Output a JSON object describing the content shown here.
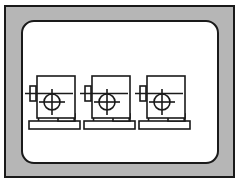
{
  "figure": {
    "kind": "technical-line-drawing",
    "background_color": "#ffffff",
    "frame": {
      "outer_stroke_color": "#1a1a1a",
      "band_fill_color": "#b6b6b6",
      "inner_panel_fill_color": "#ffffff",
      "inner_panel_stroke_color": "#1a1a1a",
      "inner_panel_corner_radius": 13
    },
    "line_color": "#1a1a1a",
    "fill_color": "#ffffff",
    "machine_count": 3,
    "machines": [
      {
        "label": "machine-1",
        "origin_x": 8,
        "origin_y": 0
      },
      {
        "label": "machine-2",
        "origin_x": 63,
        "origin_y": 0
      },
      {
        "label": "machine-3",
        "origin_x": 118,
        "origin_y": 0
      }
    ],
    "machine_parts": [
      "column-body",
      "spindle-bracket",
      "horizontal-axis-line",
      "crosshair-circle",
      "table-riser-block",
      "base-plate",
      "left-leg",
      "right-leg"
    ],
    "geometry": {
      "body_x": 8,
      "body_y": 56,
      "body_width": 38,
      "body_height": 42,
      "bracket_x": 0,
      "bracket_y": 66,
      "bracket_width": 6,
      "bracket_height": 15,
      "axis_line_y": 73,
      "axis_line_x1": -4,
      "axis_line_x2": 44,
      "circle_cx": 23,
      "circle_cy": 82,
      "circle_r": 8,
      "crosshair_half": 13,
      "riser_x": 29,
      "riser_y": 94,
      "riser_width": 17,
      "riser_height": 7,
      "base_x": 0,
      "base_y": 101,
      "base_width": 51,
      "base_height": 8
    }
  }
}
